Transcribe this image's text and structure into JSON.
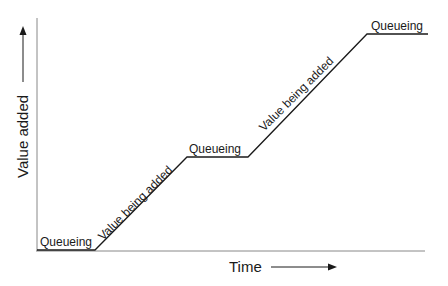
{
  "diagram": {
    "type": "value-added-over-time",
    "axes": {
      "x_label": "Time",
      "y_label": "Value added"
    },
    "segments": [
      {
        "label": "Queueing",
        "kind": "flat"
      },
      {
        "label": "Value being added",
        "kind": "rising"
      },
      {
        "label": "Queueing",
        "kind": "flat"
      },
      {
        "label": "Value being added",
        "kind": "rising"
      },
      {
        "label": "Queueing",
        "kind": "flat"
      }
    ],
    "colors": {
      "line": "#1a1a1a",
      "axis": "#777777",
      "background": "#ffffff"
    }
  }
}
